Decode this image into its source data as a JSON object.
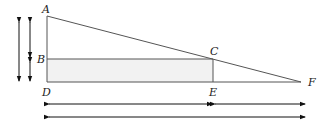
{
  "diagram": {
    "type": "geometry-similar-triangles",
    "points": {
      "A": {
        "label": "A",
        "x": 47,
        "y": 16
      },
      "B": {
        "label": "B",
        "x": 47,
        "y": 59
      },
      "C": {
        "label": "C",
        "x": 213,
        "y": 59
      },
      "D": {
        "label": "D",
        "x": 47,
        "y": 82
      },
      "E": {
        "label": "E",
        "x": 213,
        "y": 82
      },
      "F": {
        "label": "F",
        "x": 301,
        "y": 82
      }
    },
    "colors": {
      "stroke": "#555555",
      "fill": "#f2f2f2",
      "text": "#222222"
    }
  }
}
